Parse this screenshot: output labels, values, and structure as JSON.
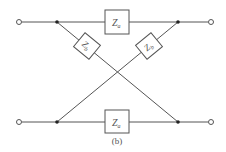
{
  "diagram": {
    "type": "lattice-network",
    "caption": "(b)",
    "colors": {
      "line": "#555555",
      "box_fill": "#ffffff",
      "dot": "#222222"
    },
    "components": {
      "top": {
        "symbol": "Z",
        "subscript": "a"
      },
      "bottom": {
        "symbol": "Z",
        "subscript": "a"
      },
      "diag_left": {
        "symbol": "Z",
        "subscript": "b"
      },
      "diag_right": {
        "symbol": "Z",
        "subscript": "b"
      }
    },
    "terminals": [
      "top-left",
      "top-right",
      "bottom-left",
      "bottom-right"
    ],
    "nodes": [
      "junction-top-left",
      "junction-top-right",
      "junction-bottom-left",
      "junction-bottom-right"
    ]
  }
}
